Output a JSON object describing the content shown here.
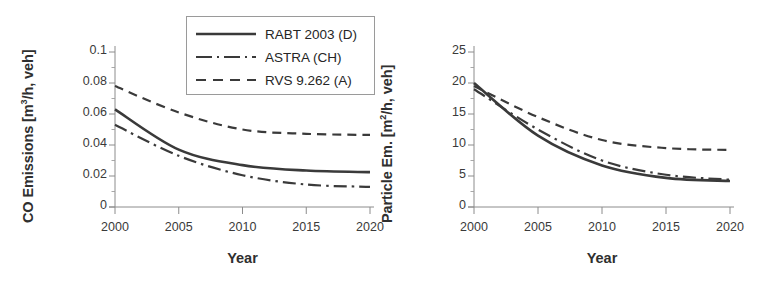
{
  "figure": {
    "background": "#ffffff",
    "line_color": "#3a3a3a"
  },
  "legend": {
    "position": "top-right-of-left-panel",
    "entries": [
      {
        "label": "RABT 2003 (D)",
        "style": "solid",
        "swatch": "solid-line-swatch"
      },
      {
        "label": "ASTRA (CH)",
        "style": "dashdot",
        "swatch": "dash-dot-line-swatch"
      },
      {
        "label": "RVS 9.262 (A)",
        "style": "dashed",
        "swatch": "dashed-line-swatch"
      }
    ]
  },
  "chart_data": [
    {
      "type": "line",
      "panel": "left",
      "title": "",
      "xlabel": "Year",
      "ylabel": "CO Emissions [m³/h, veh]",
      "ylabel_main": "CO Emissions [m",
      "ylabel_sup": "3",
      "ylabel_tail": "/h, veh]",
      "x": [
        2000,
        2005,
        2010,
        2015,
        2020
      ],
      "xlim": [
        2000,
        2020
      ],
      "ylim": [
        0,
        0.1
      ],
      "xticks": [
        "2000",
        "2005",
        "2010",
        "2015",
        "2020"
      ],
      "yticks": [
        "0",
        "0.02",
        "0.04",
        "0.06",
        "0.08",
        "0.1"
      ],
      "ytick_values": [
        0,
        0.02,
        0.04,
        0.06,
        0.08,
        0.1
      ],
      "grid": false,
      "legend_position": "upper right",
      "series": [
        {
          "name": "RABT 2003 (D)",
          "style": "solid",
          "values": [
            0.063,
            0.037,
            0.027,
            0.0235,
            0.0225
          ]
        },
        {
          "name": "ASTRA (CH)",
          "style": "dashdot",
          "values": [
            0.053,
            0.033,
            0.0205,
            0.0145,
            0.013
          ]
        },
        {
          "name": "RVS 9.262 (A)",
          "style": "dashed",
          "values": [
            0.078,
            0.061,
            0.05,
            0.0472,
            0.0465
          ]
        }
      ]
    },
    {
      "type": "line",
      "panel": "right",
      "title": "",
      "xlabel": "Year",
      "ylabel": "Particle Em. [m²/h, veh]",
      "ylabel_main": "Particle Em. [m",
      "ylabel_sup": "2",
      "ylabel_tail": "/h, veh]",
      "x": [
        2000,
        2005,
        2010,
        2015,
        2020
      ],
      "xlim": [
        2000,
        2020
      ],
      "ylim": [
        0,
        25
      ],
      "xticks": [
        "2000",
        "2005",
        "2010",
        "2015",
        "2020"
      ],
      "yticks": [
        "0",
        "5",
        "10",
        "15",
        "20",
        "25"
      ],
      "ytick_values": [
        0,
        5,
        10,
        15,
        20,
        25
      ],
      "grid": false,
      "legend_position": "none",
      "series": [
        {
          "name": "RABT 2003 (D)",
          "style": "solid",
          "values": [
            20.0,
            11.5,
            6.7,
            4.7,
            4.2
          ]
        },
        {
          "name": "ASTRA (CH)",
          "style": "dashdot",
          "values": [
            19.0,
            12.5,
            7.5,
            5.2,
            4.4
          ]
        },
        {
          "name": "RVS 9.262 (A)",
          "style": "dashed",
          "values": [
            19.5,
            14.5,
            10.8,
            9.5,
            9.2
          ]
        }
      ]
    }
  ]
}
